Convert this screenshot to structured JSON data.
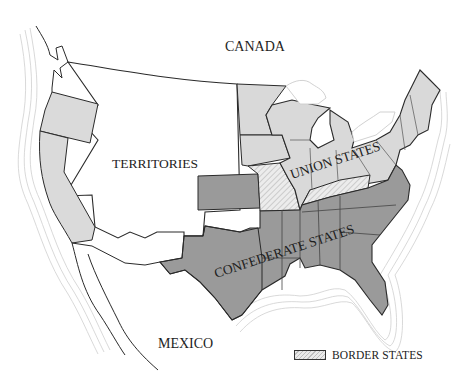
{
  "map": {
    "title": "",
    "labels": {
      "canada": "CANADA",
      "territories": "TERRITORIES",
      "union_states": "UNION STATES",
      "confederate_states": "CONFEDERATE STATES",
      "mexico": "MEXICO"
    },
    "legend": {
      "border_states_label": "BORDER STATES"
    },
    "colors": {
      "territories": "#ffffff",
      "union_states": "#d9d9d9",
      "confederate_states": "#9a9a9a",
      "border_states": "#e6e6e6",
      "pacific_states": "#dadada",
      "lakes": "#ffffff",
      "outline": "#2a2a2a",
      "coast_lines": "#c8c8c8"
    }
  }
}
